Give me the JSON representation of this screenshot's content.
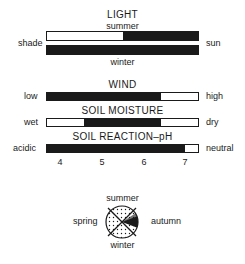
{
  "light": {
    "title": "LIGHT",
    "top_label": "summer",
    "bottom_label": "winter",
    "left_label": "shade",
    "right_label": "sun",
    "summer_bar": {
      "dark_from": 0.503,
      "dark_to": 1.0
    },
    "winter_bar": {
      "dark_from": 0.0,
      "dark_to": 1.0
    }
  },
  "wind": {
    "title": "WIND",
    "left_label": "low",
    "right_label": "high",
    "bar": {
      "dark_from": 0.0,
      "dark_to": 0.752
    }
  },
  "soil_moisture": {
    "title": "SOIL MOISTURE",
    "left_label": "wet",
    "right_label": "dry",
    "bar": {
      "dark_from": 0.248,
      "dark_to": 0.752
    }
  },
  "soil_reaction": {
    "title": "SOIL REACTION–pH",
    "left_label": "acidic",
    "right_label": "neutral",
    "bar": {
      "dark_from": 0.0,
      "dark_to": 0.915
    }
  },
  "ph_scale": {
    "ticks": [
      "4",
      "5",
      "6",
      "7"
    ]
  },
  "season_diagram": {
    "top_label": "summer",
    "bottom_label": "winter",
    "left_label": "spring",
    "right_label": "autumn",
    "fill_pattern": "stipple",
    "highlight_segment": "autumn wedge (black)"
  },
  "colors": {
    "ink": "#1a1a1a",
    "paper": "#ffffff"
  }
}
